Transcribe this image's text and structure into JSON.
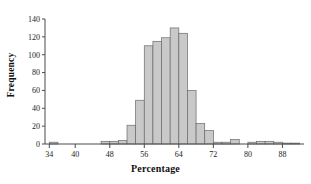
{
  "chart_data": {
    "type": "bar",
    "title": "",
    "subtitle": "",
    "xlabel": "Percentage",
    "ylabel": "Frequency",
    "xlim": [
      33,
      93
    ],
    "ylim": [
      0,
      140
    ],
    "bin_width": 2,
    "grid": false,
    "legend": null,
    "annotations": [],
    "xticks": [
      34,
      40,
      48,
      56,
      64,
      72,
      80,
      88
    ],
    "xtick_labels": [
      "34",
      "40",
      "48",
      "56",
      "64",
      "72",
      "80",
      "88"
    ],
    "yticks": [
      0,
      20,
      40,
      60,
      80,
      100,
      120,
      140
    ],
    "ytick_labels": [
      "0",
      "20",
      "40",
      "60",
      "80",
      "100",
      "120",
      "140"
    ],
    "bar_fill_color": "#c9c9c9",
    "bar_edge_color": "#6a6a6a",
    "axis_color": "#4a4a4a",
    "categories": [
      34,
      36,
      38,
      40,
      42,
      44,
      46,
      48,
      50,
      52,
      54,
      56,
      58,
      60,
      62,
      64,
      66,
      68,
      70,
      72,
      74,
      76,
      78,
      80,
      82,
      84,
      86,
      88,
      90
    ],
    "bin_starts": [
      34,
      36,
      38,
      40,
      42,
      44,
      46,
      48,
      50,
      52,
      54,
      56,
      58,
      60,
      62,
      64,
      66,
      68,
      70,
      72,
      74,
      76,
      78,
      80,
      82,
      84,
      86,
      88,
      90
    ],
    "values": [
      2,
      0,
      0,
      0,
      0,
      0,
      3,
      3,
      4,
      21,
      49,
      110,
      115,
      119,
      130,
      124,
      60,
      23,
      15,
      2,
      2,
      5,
      0,
      2,
      3,
      3,
      2,
      1,
      1
    ],
    "series": [
      {
        "name": "Frequency",
        "values": [
          2,
          0,
          0,
          0,
          0,
          0,
          3,
          3,
          4,
          21,
          49,
          110,
          115,
          119,
          130,
          124,
          60,
          23,
          15,
          2,
          2,
          5,
          0,
          2,
          3,
          3,
          2,
          1,
          1
        ]
      }
    ],
    "peak_value": 130,
    "peak_bin": 62
  }
}
